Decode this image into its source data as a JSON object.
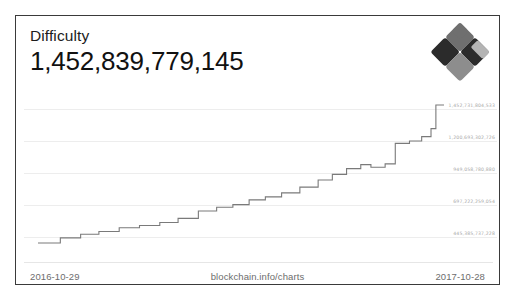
{
  "page": {
    "background_color": "#ffffff",
    "clipped_top_text": "· · · · · · · · · · · · · · · · · · · · · ·"
  },
  "card": {
    "border_color": "#3a3a3a",
    "background_color": "#ffffff"
  },
  "header": {
    "metric_label": "Difficulty",
    "metric_value": "1,452,839,779,145",
    "logo_name": "blockchain-info-logo",
    "logo_colors": {
      "dark": "#2b2b2b",
      "mid": "#6f6f6f",
      "light": "#b4b4b4",
      "pale": "#8d8d8d"
    }
  },
  "footer": {
    "start_date": "2016-10-29",
    "source": "blockchain.info/charts",
    "end_date": "2017-10-28"
  },
  "chart_data": {
    "type": "line",
    "title": "Difficulty",
    "xlabel": "",
    "ylabel": "",
    "grid": true,
    "legend": "none",
    "line_color": "#7a7a7a",
    "x_range": [
      "2016-10-29",
      "2017-10-28"
    ],
    "ytick_labels": [
      "1,452,731,804,533",
      "1,200,693,302,726",
      "949,058,780,880",
      "697,222,259,054",
      "445,385,737,228"
    ],
    "ytick_values": [
      1452731804533,
      1200693302726,
      949058780880,
      697222259054,
      445385737228
    ],
    "ylim": [
      330000000000,
      1500000000000
    ],
    "series": [
      {
        "name": "Difficulty",
        "points": [
          [
            0.0,
            3.3
          ],
          [
            0.055,
            3.3
          ],
          [
            0.055,
            3.6
          ],
          [
            0.105,
            3.6
          ],
          [
            0.105,
            3.82
          ],
          [
            0.15,
            3.82
          ],
          [
            0.15,
            3.98
          ],
          [
            0.2,
            3.98
          ],
          [
            0.2,
            4.2
          ],
          [
            0.25,
            4.2
          ],
          [
            0.25,
            4.34
          ],
          [
            0.3,
            4.34
          ],
          [
            0.3,
            4.52
          ],
          [
            0.345,
            4.52
          ],
          [
            0.345,
            4.76
          ],
          [
            0.395,
            4.76
          ],
          [
            0.395,
            5.2
          ],
          [
            0.44,
            5.2
          ],
          [
            0.44,
            5.42
          ],
          [
            0.48,
            5.42
          ],
          [
            0.48,
            5.58
          ],
          [
            0.52,
            5.58
          ],
          [
            0.52,
            5.86
          ],
          [
            0.56,
            5.86
          ],
          [
            0.56,
            6.04
          ],
          [
            0.6,
            6.04
          ],
          [
            0.6,
            6.28
          ],
          [
            0.645,
            6.28
          ],
          [
            0.645,
            6.62
          ],
          [
            0.69,
            6.62
          ],
          [
            0.69,
            7.04
          ],
          [
            0.725,
            7.04
          ],
          [
            0.725,
            7.38
          ],
          [
            0.76,
            7.38
          ],
          [
            0.76,
            7.72
          ],
          [
            0.795,
            7.72
          ],
          [
            0.795,
            7.96
          ],
          [
            0.82,
            7.96
          ],
          [
            0.82,
            7.8
          ],
          [
            0.855,
            7.8
          ],
          [
            0.855,
            8.0
          ],
          [
            0.88,
            8.0
          ],
          [
            0.88,
            9.22
          ],
          [
            0.915,
            9.22
          ],
          [
            0.915,
            9.36
          ],
          [
            0.945,
            9.36
          ],
          [
            0.945,
            9.62
          ],
          [
            0.968,
            9.62
          ],
          [
            0.968,
            10.1
          ],
          [
            0.98,
            10.1
          ],
          [
            0.98,
            11.5
          ],
          [
            1.0,
            11.5
          ]
        ]
      }
    ]
  }
}
